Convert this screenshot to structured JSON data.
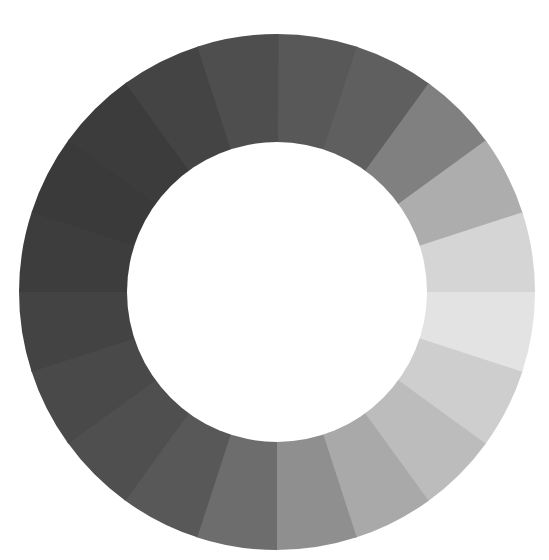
{
  "canvas": {
    "width": 549,
    "height": 560,
    "background": "#ffffff"
  },
  "ring": {
    "center_x": 277,
    "center_y": 292,
    "outer_radius": 258,
    "inner_radius": 150,
    "start_angle_deg": 0,
    "direction": "clockwise",
    "segment_count": 20,
    "segments": [
      {
        "index": 0,
        "start_deg": 0,
        "end_deg": 18,
        "color": "#585858"
      },
      {
        "index": 1,
        "start_deg": 18,
        "end_deg": 36,
        "color": "#5f5f5f"
      },
      {
        "index": 2,
        "start_deg": 36,
        "end_deg": 54,
        "color": "#808080"
      },
      {
        "index": 3,
        "start_deg": 54,
        "end_deg": 72,
        "color": "#adadad"
      },
      {
        "index": 4,
        "start_deg": 72,
        "end_deg": 90,
        "color": "#d5d5d5"
      },
      {
        "index": 5,
        "start_deg": 90,
        "end_deg": 108,
        "color": "#e3e3e3"
      },
      {
        "index": 6,
        "start_deg": 108,
        "end_deg": 126,
        "color": "#cecece"
      },
      {
        "index": 7,
        "start_deg": 126,
        "end_deg": 144,
        "color": "#bcbcbc"
      },
      {
        "index": 8,
        "start_deg": 144,
        "end_deg": 162,
        "color": "#a9a9a9"
      },
      {
        "index": 9,
        "start_deg": 162,
        "end_deg": 180,
        "color": "#8f8f8f"
      },
      {
        "index": 10,
        "start_deg": 180,
        "end_deg": 198,
        "color": "#6d6d6d"
      },
      {
        "index": 11,
        "start_deg": 198,
        "end_deg": 216,
        "color": "#585858"
      },
      {
        "index": 12,
        "start_deg": 216,
        "end_deg": 234,
        "color": "#4f4f4f"
      },
      {
        "index": 13,
        "start_deg": 234,
        "end_deg": 252,
        "color": "#494949"
      },
      {
        "index": 14,
        "start_deg": 252,
        "end_deg": 270,
        "color": "#434343"
      },
      {
        "index": 15,
        "start_deg": 270,
        "end_deg": 288,
        "color": "#3d3d3d"
      },
      {
        "index": 16,
        "start_deg": 288,
        "end_deg": 306,
        "color": "#3a3a3a"
      },
      {
        "index": 17,
        "start_deg": 306,
        "end_deg": 324,
        "color": "#3c3c3c"
      },
      {
        "index": 18,
        "start_deg": 324,
        "end_deg": 342,
        "color": "#444444"
      },
      {
        "index": 19,
        "start_deg": 342,
        "end_deg": 360,
        "color": "#4e4e4e"
      }
    ]
  }
}
